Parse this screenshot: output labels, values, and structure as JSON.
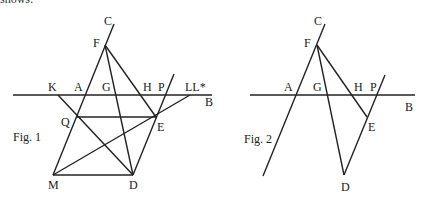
{
  "top_text": "shows:",
  "fig1": {
    "caption": "Fig. 1",
    "labels": {
      "C": "C",
      "F": "F",
      "K": "K",
      "A": "A",
      "G": "G",
      "H": "H",
      "P": "P",
      "LL": "LL*",
      "B": "B",
      "Q": "Q",
      "E": "E",
      "M": "M",
      "D": "D"
    }
  },
  "fig2": {
    "caption": "Fig. 2",
    "labels": {
      "C": "C",
      "F": "F",
      "A": "A",
      "G": "G",
      "H": "H",
      "P": "P",
      "B": "B",
      "E": "E",
      "D": "D"
    }
  }
}
